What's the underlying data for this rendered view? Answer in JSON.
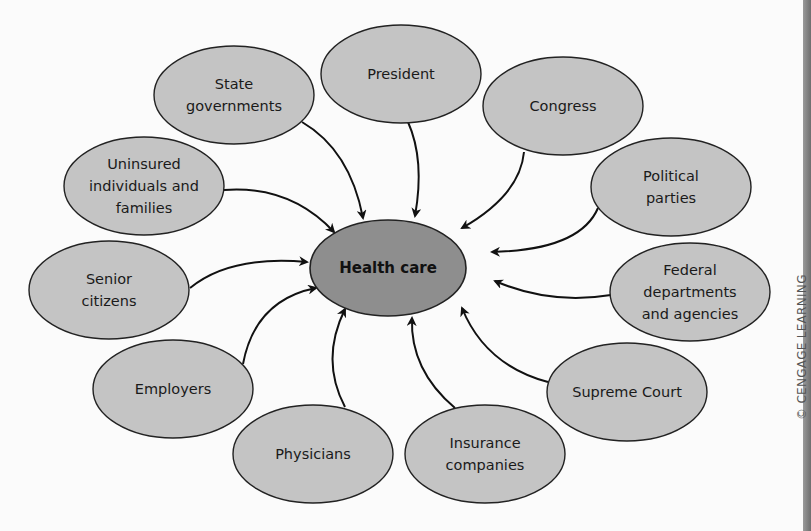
{
  "diagram": {
    "center": {
      "label": "Health care",
      "cx": 388,
      "cy": 268,
      "rx": 78,
      "ry": 48,
      "fill": "#8e8e8e"
    },
    "node_fill": "#c4c4c4",
    "stroke": "#222222",
    "nodes": [
      {
        "id": "state-governments",
        "lines": [
          "State",
          "governments"
        ],
        "cx": 234,
        "cy": 95
      },
      {
        "id": "president",
        "lines": [
          "President"
        ],
        "cx": 401,
        "cy": 74
      },
      {
        "id": "congress",
        "lines": [
          "Congress"
        ],
        "cx": 563,
        "cy": 106
      },
      {
        "id": "political-parties",
        "lines": [
          "Political",
          "parties"
        ],
        "cx": 671,
        "cy": 187
      },
      {
        "id": "uninsured",
        "lines": [
          "Uninsured",
          "individuals and",
          "families"
        ],
        "cx": 144,
        "cy": 186
      },
      {
        "id": "senior-citizens",
        "lines": [
          "Senior",
          "citizens"
        ],
        "cx": 109,
        "cy": 290
      },
      {
        "id": "employers",
        "lines": [
          "Employers"
        ],
        "cx": 173,
        "cy": 389
      },
      {
        "id": "physicians",
        "lines": [
          "Physicians"
        ],
        "cx": 313,
        "cy": 454
      },
      {
        "id": "insurance-companies",
        "lines": [
          "Insurance",
          "companies"
        ],
        "cx": 485,
        "cy": 454
      },
      {
        "id": "supreme-court",
        "lines": [
          "Supreme Court"
        ],
        "cx": 627,
        "cy": 392
      },
      {
        "id": "federal-departments",
        "lines": [
          "Federal",
          "departments",
          "and agencies"
        ],
        "cx": 690,
        "cy": 292
      }
    ],
    "arrows": [
      {
        "from": "state-governments",
        "d": "M302,122 Q350,150 363,218"
      },
      {
        "from": "president",
        "d": "M408,122 Q425,160 415,216"
      },
      {
        "from": "congress",
        "d": "M524,152 Q520,195 462,228"
      },
      {
        "from": "political-parties",
        "d": "M598,208 Q580,250 492,252"
      },
      {
        "from": "uninsured",
        "d": "M224,190 Q290,185 334,232"
      },
      {
        "from": "senior-citizens",
        "d": "M190,288 Q230,255 307,262"
      },
      {
        "from": "employers",
        "d": "M243,364 Q255,300 316,288"
      },
      {
        "from": "physicians",
        "d": "M345,407 Q320,360 345,309"
      },
      {
        "from": "insurance-companies",
        "d": "M455,408 Q410,370 412,318"
      },
      {
        "from": "supreme-court",
        "d": "M548,382 Q485,365 462,308"
      },
      {
        "from": "federal-departments",
        "d": "M611,295 Q550,305 495,281"
      }
    ]
  },
  "credit": "© CENGAGE LEARNING"
}
